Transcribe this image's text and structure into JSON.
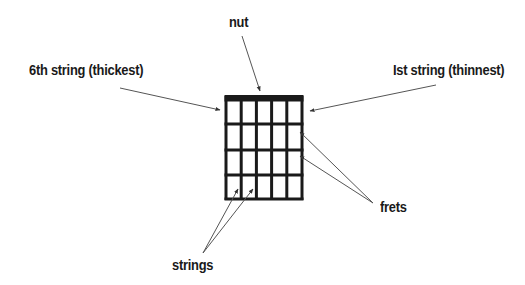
{
  "diagram": {
    "labels": {
      "nut": "nut",
      "sixth_string": "6th string (thickest)",
      "first_string": "Ist string (thinnest)",
      "frets": "frets",
      "strings": "strings"
    },
    "fretboard": {
      "strings": 6,
      "frets": 4,
      "line_color": "#1a1a1a",
      "arrow_color": "#555555"
    }
  }
}
